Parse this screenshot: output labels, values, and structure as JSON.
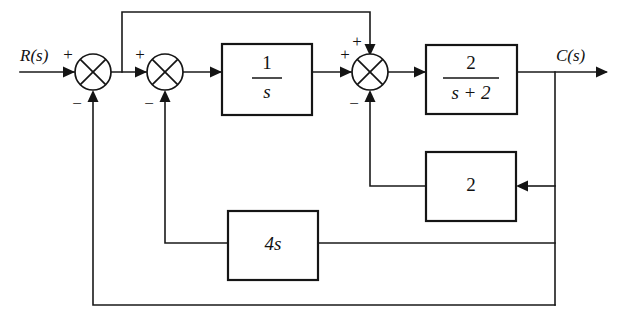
{
  "diagram": {
    "input_label": "R(s)",
    "output_label": "C(s)",
    "line_color": "#151515",
    "background_color": "#ffffff",
    "blocks": [
      {
        "id": "integrator",
        "name": "integrator-block",
        "numerator": "1",
        "denominator": "s",
        "display": "1/s"
      },
      {
        "id": "plant",
        "name": "plant-block",
        "numerator": "2",
        "denominator": "s + 2",
        "display": "2/(s+2)"
      },
      {
        "id": "gain-two",
        "name": "gain-2-block",
        "label": "2"
      },
      {
        "id": "gain-four-s",
        "name": "gain-4s-block",
        "label": "4s"
      }
    ],
    "summing_junctions": [
      {
        "id": "sum1",
        "name": "summing-junction-1",
        "signs": {
          "left": "+",
          "bottom": "-"
        }
      },
      {
        "id": "sum2",
        "name": "summing-junction-2",
        "signs": {
          "left": "+",
          "bottom": "-"
        }
      },
      {
        "id": "sum3",
        "name": "summing-junction-3",
        "signs": {
          "left": "+",
          "top": "+",
          "bottom": "-"
        }
      }
    ],
    "signs": {
      "plus": "+",
      "minus": "−"
    },
    "fraction_numerators": {
      "integrator": "1",
      "plant": "2"
    },
    "fraction_denominators": {
      "integrator": "s",
      "plant": "s + 2"
    },
    "gain_labels": {
      "two": "2",
      "four_s": "4s"
    }
  }
}
